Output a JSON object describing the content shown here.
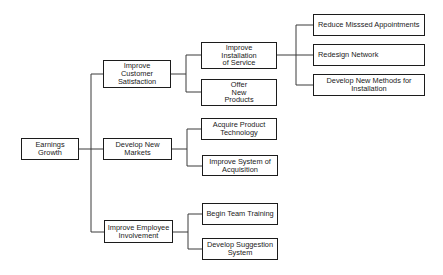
{
  "diagram": {
    "type": "tree",
    "root": {
      "id": "earnings",
      "label": "Earnings\nGrowth"
    },
    "level1": [
      {
        "id": "customer",
        "label": "Improve\nCustomer\nSatisfaction"
      },
      {
        "id": "markets",
        "label": "Develop New\nMarkets"
      },
      {
        "id": "employee",
        "label": "Improve Employee\nInvolvement"
      }
    ],
    "level2": [
      {
        "id": "installation",
        "parent": "customer",
        "label": "Improve\nInstallation\nof Service"
      },
      {
        "id": "products",
        "parent": "customer",
        "label": "Offer\nNew\nProducts"
      },
      {
        "id": "acquire",
        "parent": "markets",
        "label": "Acquire Product\nTechnology"
      },
      {
        "id": "acquisition",
        "parent": "markets",
        "label": "Improve System of\nAcquisition"
      },
      {
        "id": "training",
        "parent": "employee",
        "label": "Begin Team Training"
      },
      {
        "id": "suggestion",
        "parent": "employee",
        "label": "Develop Suggestion\nSystem"
      }
    ],
    "level3": [
      {
        "id": "appointments",
        "parent": "installation",
        "label": "Reduce Misssed Appointments"
      },
      {
        "id": "network",
        "parent": "installation",
        "label": "Redesign Network"
      },
      {
        "id": "methods",
        "parent": "installation",
        "label": "Develop New Methods for\nInstallation"
      }
    ]
  }
}
